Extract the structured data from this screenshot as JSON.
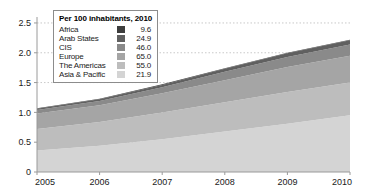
{
  "chart_data": {
    "type": "area",
    "stacked": true,
    "title": "",
    "subtitle": "",
    "xlabel": "",
    "ylabel": "",
    "x": [
      2005,
      2006,
      2007,
      2008,
      2009,
      2010
    ],
    "xtick_labels": [
      "2005",
      "2006",
      "2007",
      "2008",
      "2009",
      "2010"
    ],
    "ytick_labels": [
      "0",
      "0.5",
      "1.0",
      "1.5",
      "2.0",
      "2.5"
    ],
    "ytick_values": [
      0,
      0.5,
      1.0,
      1.5,
      2.0,
      2.5
    ],
    "ylim": [
      0,
      2.6
    ],
    "xlim": [
      2005,
      2010
    ],
    "grid": "horizontal-dotted",
    "legend_position": "top-left-inside",
    "series": [
      {
        "name": "Asia & Pacific",
        "value_2010": "21.9",
        "color": "#d4d4d4",
        "values": [
          0.36,
          0.44,
          0.55,
          0.68,
          0.81,
          0.95
        ]
      },
      {
        "name": "The Americas",
        "value_2010": "55.0",
        "color": "#bdbdbd",
        "values": [
          0.36,
          0.4,
          0.45,
          0.49,
          0.53,
          0.55
        ]
      },
      {
        "name": "Europe",
        "value_2010": "65.0",
        "color": "#a5a5a5",
        "values": [
          0.26,
          0.28,
          0.32,
          0.37,
          0.42,
          0.45
        ]
      },
      {
        "name": "CIS",
        "value_2010": "46.0",
        "color": "#8a8a8a",
        "values": [
          0.06,
          0.07,
          0.1,
          0.14,
          0.17,
          0.19
        ]
      },
      {
        "name": "Arab States",
        "value_2010": "24.9",
        "color": "#606060",
        "values": [
          0.02,
          0.03,
          0.04,
          0.05,
          0.06,
          0.07
        ]
      },
      {
        "name": "Africa",
        "value_2010": "9.6",
        "color": "#3d3d3d",
        "values": [
          0.01,
          0.01,
          0.01,
          0.01,
          0.01,
          0.01
        ]
      }
    ]
  },
  "legend": {
    "title": "Per 100 inhabitants, 2010",
    "rows": [
      {
        "label": "Africa",
        "value": "9.6",
        "color": "#3d3d3d"
      },
      {
        "label": "Arab States",
        "value": "24.9",
        "color": "#606060"
      },
      {
        "label": "CIS",
        "value": "46.0",
        "color": "#8a8a8a"
      },
      {
        "label": "Europe",
        "value": "65.0",
        "color": "#a5a5a5"
      },
      {
        "label": "The Americas",
        "value": "55.0",
        "color": "#bdbdbd"
      },
      {
        "label": "Asia & Pacific",
        "value": "21.9",
        "color": "#d4d4d4"
      }
    ]
  },
  "axes": {
    "y_labels": [
      "2.5",
      "2.0",
      "1.5",
      "1.0",
      "0.5",
      "0"
    ],
    "x_labels": [
      "2005",
      "2006",
      "2007",
      "2008",
      "2009",
      "2010"
    ]
  },
  "colors": {
    "axis": "#9a9a9a",
    "grid": "#c9c9c9",
    "text": "#1a1a1a",
    "background": "#ffffff"
  }
}
